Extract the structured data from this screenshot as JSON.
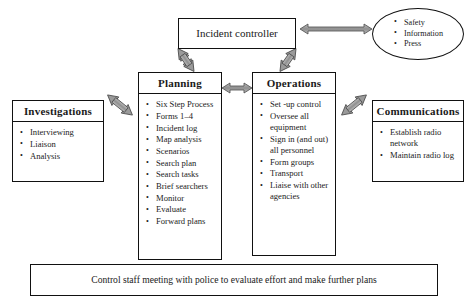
{
  "diagram": {
    "nodes": {
      "incident_controller": {
        "label": "Incident controller"
      },
      "media_ellipse": {
        "items": [
          "Safety",
          "Information",
          "Press"
        ]
      },
      "planning": {
        "title": "Planning",
        "items": [
          "Six Step Process",
          "Forms 1–4",
          "Incident log",
          "Map analysis",
          "Scenarios",
          "Search plan",
          "Search tasks",
          "Brief searchers",
          "Monitor",
          "Evaluate",
          "Forward plans"
        ]
      },
      "operations": {
        "title": "Operations",
        "items": [
          "Set -up control",
          "Oversee all equipment",
          "Sign in (and out) all personnel",
          "Form groups",
          "Transport",
          "Liaise with other agencies"
        ]
      },
      "investigations": {
        "title": "Investigations",
        "items": [
          "Interviewing",
          "Liaison",
          "Analysis"
        ]
      },
      "communications": {
        "title": "Communications",
        "items": [
          "Establish radio network",
          "Maintain radio log"
        ]
      },
      "bottom_bar": {
        "label": "Control staff meeting with police to evaluate effort and make further plans"
      }
    },
    "connectors": [
      {
        "name": "controller-to-media",
        "from": "incident_controller",
        "to": "media_ellipse",
        "style": "double-headed"
      },
      {
        "name": "controller-to-planning",
        "from": "incident_controller",
        "to": "planning",
        "style": "double-headed"
      },
      {
        "name": "controller-to-operations",
        "from": "incident_controller",
        "to": "operations",
        "style": "double-headed"
      },
      {
        "name": "planning-to-operations",
        "from": "planning",
        "to": "operations",
        "style": "double-headed"
      },
      {
        "name": "planning-to-investigations",
        "from": "planning",
        "to": "investigations",
        "style": "double-headed"
      },
      {
        "name": "operations-to-communications",
        "from": "operations",
        "to": "communications",
        "style": "double-headed"
      }
    ],
    "colors": {
      "border": "#111111",
      "background": "#ffffff",
      "arrow_fill": "#9a9a9a",
      "arrow_stroke": "#4a4a4a",
      "text": "#1a1a1a"
    }
  }
}
